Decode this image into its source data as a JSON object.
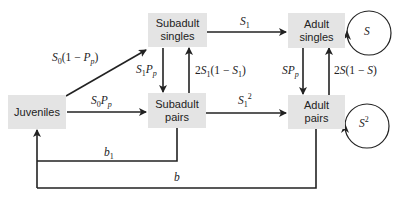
{
  "diagram": {
    "nodes": {
      "juveniles": "Juveniles",
      "subadult_singles_1": "Subadult",
      "subadult_singles_2": "singles",
      "subadult_pairs_1": "Subadult",
      "subadult_pairs_2": "pairs",
      "adult_singles_1": "Adult",
      "adult_singles_2": "singles",
      "adult_pairs_1": "Adult",
      "adult_pairs_2": "pairs"
    },
    "edges": {
      "juv_to_subsingles": {
        "a": "S",
        "a_sub": "0",
        "b": "(1 − ",
        "c": "P",
        "c_sub": "p",
        "d": ")"
      },
      "juv_to_subpairs": {
        "a": "S",
        "a_sub": "0",
        "b": "P",
        "b_sub": "p"
      },
      "subsingles_to_subpairs": {
        "a": "S",
        "a_sub": "1",
        "b": "P",
        "b_sub": "p"
      },
      "subpairs_to_subsingles": {
        "pre": "2",
        "a": "S",
        "a_sub": "1",
        "b": "(1 − ",
        "c": "S",
        "c_sub": "1",
        "d": ")"
      },
      "subsingles_to_adultsingles": {
        "a": "S",
        "a_sub": "1"
      },
      "subpairs_to_adultpairs": {
        "a": "S",
        "a_sub": "1",
        "a_sup": "2"
      },
      "adultsingles_to_adultpairs": {
        "a": "SP",
        "a_sub": "p"
      },
      "adultpairs_to_adultsingles": {
        "pre": "2",
        "a": "S",
        "b": "(1 − ",
        "c": "S",
        "d": ")"
      },
      "adultsingles_self": {
        "a": "S"
      },
      "adultpairs_self": {
        "a": "S",
        "a_sup": "2"
      },
      "subpairs_to_juv": {
        "a": "b",
        "a_sub": "1"
      },
      "adultpairs_to_juv": {
        "a": "b"
      }
    }
  }
}
